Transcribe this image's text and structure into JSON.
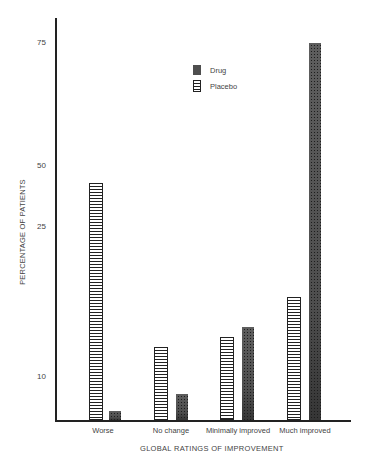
{
  "chart_data": {
    "type": "bar",
    "title": "",
    "xlabel": "GLOBAL RATINGS OF IMPROVEMENT",
    "ylabel": "PERCENTAGE OF PATIENTS",
    "categories": [
      "Worse",
      "No change",
      "Minimally improved",
      "Much improved"
    ],
    "series": [
      {
        "name": "Placebo",
        "pattern": "horizontal-stripes",
        "values": [
          43,
          13,
          14,
          18
        ]
      },
      {
        "name": "Drug",
        "pattern": "stipple",
        "values": [
          2,
          6,
          15,
          75
        ]
      }
    ],
    "y_ticks": [
      {
        "label": "75",
        "value": 75,
        "pixel_y": 43
      },
      {
        "label": "50",
        "value": 50,
        "pixel_y": 166
      },
      {
        "label": "25",
        "value": 25,
        "pixel_y": 227
      },
      {
        "label": "10",
        "value": 10,
        "pixel_y": 377
      }
    ],
    "ylim": [
      0,
      80
    ],
    "grid": false,
    "legend_position": "upper center",
    "colors": {
      "ink": "#222222",
      "text": "#444444",
      "background": "#ffffff"
    }
  },
  "legend": {
    "items": [
      {
        "label": "Drug",
        "pattern": "stipple"
      },
      {
        "label": "Placebo",
        "pattern": "horizontal-stripes"
      }
    ]
  },
  "layout": {
    "baseline_y": 420,
    "groups": [
      {
        "label_x": 103,
        "placebo_x": 89,
        "drug_x": 109
      },
      {
        "label_x": 171,
        "placebo_x": 154,
        "drug_x": 176
      },
      {
        "label_x": 238,
        "placebo_x": 220,
        "drug_x": 242
      },
      {
        "label_x": 305,
        "placebo_x": 287,
        "drug_x": 309
      }
    ],
    "placebo_width": 14,
    "drug_width": 12
  }
}
